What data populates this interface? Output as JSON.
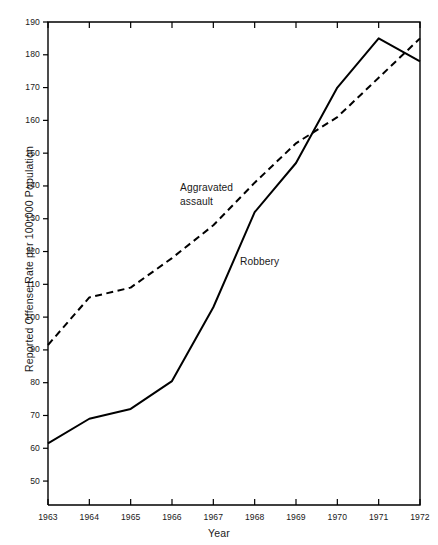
{
  "chart_data": {
    "type": "line",
    "title": "",
    "xlabel": "Year",
    "ylabel": "Reported Offense Rate per 100,000 Population",
    "x": [
      1963,
      1964,
      1965,
      1966,
      1967,
      1968,
      1969,
      1970,
      1971,
      1972
    ],
    "xtick_labels": [
      "1963",
      "1964",
      "1965",
      "1966",
      "1967",
      "1968",
      "1969",
      "1970",
      "1971",
      "1972"
    ],
    "ytick_labels": [
      "50",
      "60",
      "70",
      "80",
      "90",
      "100",
      "110",
      "120",
      "130",
      "140",
      "150",
      "160",
      "170",
      "180",
      "190"
    ],
    "yticks": [
      50,
      60,
      70,
      80,
      90,
      100,
      110,
      120,
      130,
      140,
      150,
      160,
      170,
      180,
      190
    ],
    "ylim": [
      42.7,
      190
    ],
    "xlim": [
      1963,
      1972
    ],
    "grid": false,
    "legend_position": "inline-annotations",
    "series": [
      {
        "name": "Aggravated assault",
        "style": "dashed",
        "color": "#000000",
        "values": [
          91.5,
          106,
          109,
          118,
          128,
          141,
          153,
          161,
          173,
          185
        ],
        "annotation": "Aggravated\nassault",
        "annotation_x": 180,
        "annotation_y": 181
      },
      {
        "name": "Robbery",
        "style": "solid",
        "color": "#000000",
        "values": [
          61.5,
          69,
          72,
          80.5,
          103,
          132,
          147,
          170,
          185,
          178
        ],
        "annotation": "Robbery",
        "annotation_x": 240,
        "annotation_y": 255
      }
    ]
  },
  "axes": {
    "x_title": "Year",
    "y_title": "Reported Offense Rate per 100,000 Population"
  },
  "annotations": {
    "aggravated_assault": "Aggravated\nassault",
    "robbery": "Robbery"
  }
}
